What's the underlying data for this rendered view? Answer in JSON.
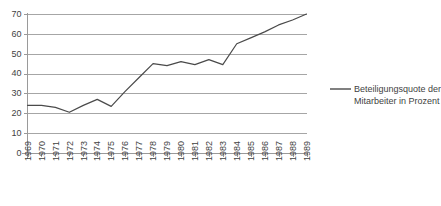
{
  "chart_data": {
    "type": "line",
    "title": "",
    "subtitle": "",
    "xlabel": "",
    "ylabel": "",
    "ylim": [
      0,
      70
    ],
    "ytick_step": 10,
    "yticks": [
      0,
      10,
      20,
      30,
      40,
      50,
      60,
      70
    ],
    "grid": true,
    "grid_axis": "y",
    "legend_position": "right",
    "categories": [
      "1969",
      "1970",
      "1971",
      "1972",
      "1973",
      "1974",
      "1975",
      "1976",
      "1977",
      "1978",
      "1979",
      "1980",
      "1981",
      "1982",
      "1983",
      "1984",
      "1985",
      "1986",
      "1987",
      "1988",
      "1989"
    ],
    "series": [
      {
        "name": "Beteiligungsquote der Mitarbeiter in Prozent",
        "color": "#4a4a4a",
        "values": [
          24,
          24,
          23,
          20.5,
          24,
          27,
          23.5,
          31,
          38,
          45,
          44,
          46,
          44.5,
          47,
          44.5,
          55,
          58,
          61,
          64.5,
          67,
          70
        ]
      }
    ]
  },
  "legend": {
    "entries": [
      {
        "label_line1": "Beteiligungsquote der",
        "label_line2": "Mitarbeiter in Prozent",
        "full_label": "Beteiligungsquote der Mitarbeiter in Prozent",
        "color": "#4a4a4a"
      }
    ]
  },
  "colors": {
    "series": "#4a4a4a",
    "gridline": "#a6a6a6",
    "axis": "#9a9a9a",
    "text": "#3f3f3f",
    "background": "#ffffff"
  }
}
